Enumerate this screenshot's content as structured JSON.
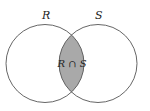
{
  "diagram": {
    "type": "venn",
    "sets": [
      {
        "label": "R",
        "cx": 45,
        "cy": 63.5,
        "r": 39
      },
      {
        "label": "S",
        "cx": 98,
        "cy": 63.5,
        "r": 39
      }
    ],
    "intersection": {
      "label": "R ∩ S",
      "fill": "#a9a9a9"
    },
    "stroke": "#555555",
    "background": "#ffffff"
  }
}
